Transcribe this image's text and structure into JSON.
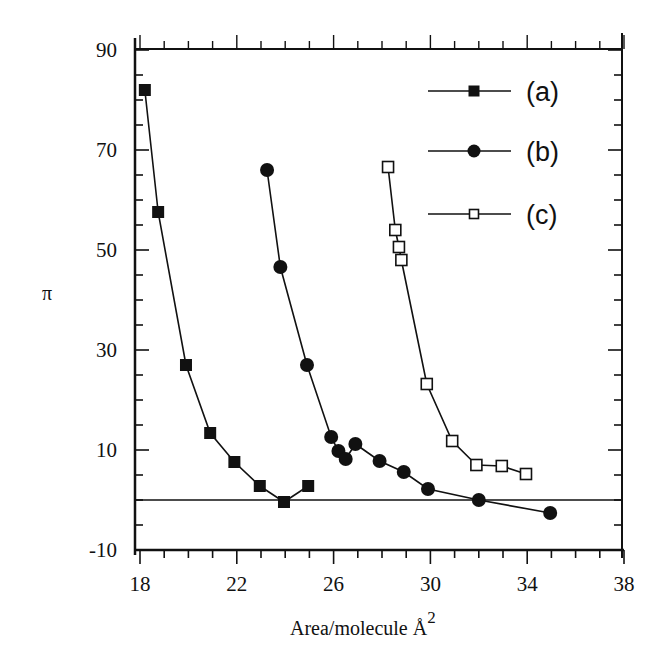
{
  "chart_data": {
    "type": "line",
    "title": "",
    "xlabel": "Area/molecule Å",
    "xlabel_superscript": "2",
    "ylabel": "π",
    "xlim": [
      18,
      38
    ],
    "ylim": [
      -10,
      90
    ],
    "x_ticks": [
      18,
      22,
      26,
      30,
      34,
      38
    ],
    "y_ticks": [
      90,
      70,
      50,
      30,
      10,
      -10
    ],
    "x_minor_step": 1,
    "y_minor_step": 5,
    "grid": false,
    "reference_line": {
      "y": 0,
      "label": "zero-pressure line"
    },
    "legend_position": "upper right",
    "series": [
      {
        "name": "(a)",
        "marker": "filled-square",
        "x": [
          18.2,
          18.75,
          19.9,
          20.9,
          21.9,
          22.95,
          23.95,
          24.95
        ],
        "y": [
          82,
          57.6,
          27,
          13.4,
          7.6,
          2.8,
          -0.4,
          2.8
        ]
      },
      {
        "name": "(b)",
        "marker": "filled-circle",
        "x": [
          23.25,
          23.8,
          24.9,
          25.9,
          26.2,
          26.5,
          26.9,
          27.9,
          28.9,
          29.9,
          32.0,
          34.95
        ],
        "y": [
          66,
          46.6,
          27,
          12.6,
          9.8,
          8.2,
          11.2,
          7.8,
          5.6,
          2.2,
          0,
          -2.6
        ]
      },
      {
        "name": "(c)",
        "marker": "open-square",
        "x": [
          28.25,
          28.55,
          28.7,
          28.8,
          29.85,
          30.9,
          31.9,
          32.95,
          33.95
        ],
        "y": [
          66.6,
          54,
          50.6,
          48,
          23.2,
          11.8,
          7,
          6.8,
          5.2
        ]
      }
    ]
  },
  "colors": {
    "ink": "#111111",
    "background": "#ffffff"
  }
}
